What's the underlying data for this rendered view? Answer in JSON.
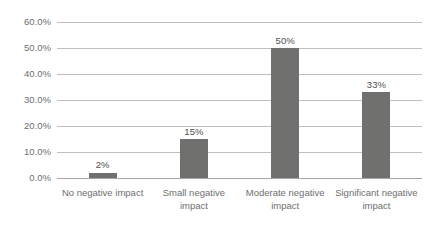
{
  "chart_data": {
    "type": "bar",
    "title": "",
    "subtitle": "",
    "xlabel": "",
    "ylabel": "",
    "categories": [
      "No negative impact",
      "Small negative impact",
      "Moderate negative impact",
      "Significant negative impact"
    ],
    "category_lines": [
      [
        "No negative impact"
      ],
      [
        "Small negative impact"
      ],
      [
        "Moderate negative",
        "impact"
      ],
      [
        "Significant negative",
        "impact"
      ]
    ],
    "values": [
      2,
      15,
      50,
      33
    ],
    "data_labels": [
      "2%",
      "15%",
      "50%",
      "33%"
    ],
    "ylim": [
      0,
      60
    ],
    "ytick_values": [
      0,
      10,
      20,
      30,
      40,
      50,
      60
    ],
    "ytick_labels": [
      "0.0%",
      "10.0%",
      "20.0%",
      "30.0%",
      "40.0%",
      "50.0%",
      "60.0%"
    ],
    "grid": true,
    "grid_orientation": "horizontal",
    "legend": false,
    "legend_position": "none",
    "series": [
      {
        "name": "",
        "values": [
          2,
          15,
          50,
          33
        ],
        "color": "#70706f"
      }
    ],
    "colors": {
      "bar": "#70706f",
      "gridline": "#bfbfbf",
      "baseline": "#a6a6a6",
      "tick_text": "#6e6e6e",
      "data_label_text": "#4f4f4f",
      "background": "#ffffff"
    }
  }
}
